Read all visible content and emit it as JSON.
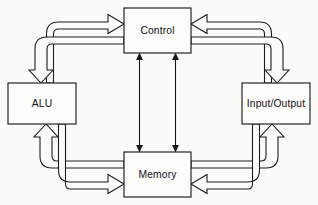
{
  "diagram": {
    "background_color": "#fbfbfa",
    "line_color": "#1d1d1d",
    "box_fill_color": "#fdfdfc",
    "nodes": [
      {
        "id": "control",
        "label": "Control",
        "position": "top-center",
        "x": 124,
        "y": 8,
        "width": 67,
        "height": 45
      },
      {
        "id": "alu",
        "label": "ALU",
        "position": "left",
        "x": 8,
        "y": 83,
        "width": 68,
        "height": 41
      },
      {
        "id": "input-output",
        "label": "Input/Output",
        "position": "right",
        "x": 242,
        "y": 83,
        "width": 68,
        "height": 41
      },
      {
        "id": "memory",
        "label": "Memory",
        "position": "bottom-center",
        "x": 124,
        "y": 152,
        "width": 67,
        "height": 45
      }
    ],
    "connections": [
      {
        "id": "alu-to-control",
        "from": "alu",
        "to": "control",
        "style": "hollow-block-arrow",
        "path": "elbow-up-right"
      },
      {
        "id": "control-to-alu",
        "from": "control",
        "to": "alu",
        "style": "hollow-block-arrow",
        "path": "elbow-left-down"
      },
      {
        "id": "alu-to-memory",
        "from": "alu",
        "to": "memory",
        "style": "hollow-block-arrow",
        "path": "elbow-down-right"
      },
      {
        "id": "memory-to-alu",
        "from": "memory",
        "to": "alu",
        "style": "hollow-block-arrow",
        "path": "elbow-left-up"
      },
      {
        "id": "io-to-control",
        "from": "input-output",
        "to": "control",
        "style": "hollow-block-arrow",
        "path": "elbow-up-left"
      },
      {
        "id": "control-to-io",
        "from": "control",
        "to": "input-output",
        "style": "hollow-block-arrow",
        "path": "elbow-right-down"
      },
      {
        "id": "io-to-memory",
        "from": "input-output",
        "to": "memory",
        "style": "hollow-block-arrow",
        "path": "elbow-down-left"
      },
      {
        "id": "memory-to-io",
        "from": "memory",
        "to": "input-output",
        "style": "hollow-block-arrow",
        "path": "elbow-right-up"
      },
      {
        "id": "control-memory-left",
        "from": "control",
        "to": "memory",
        "style": "thin-double-headed-arrow",
        "path": "vertical"
      },
      {
        "id": "control-memory-right",
        "from": "control",
        "to": "memory",
        "style": "thin-double-headed-arrow",
        "path": "vertical"
      }
    ]
  }
}
